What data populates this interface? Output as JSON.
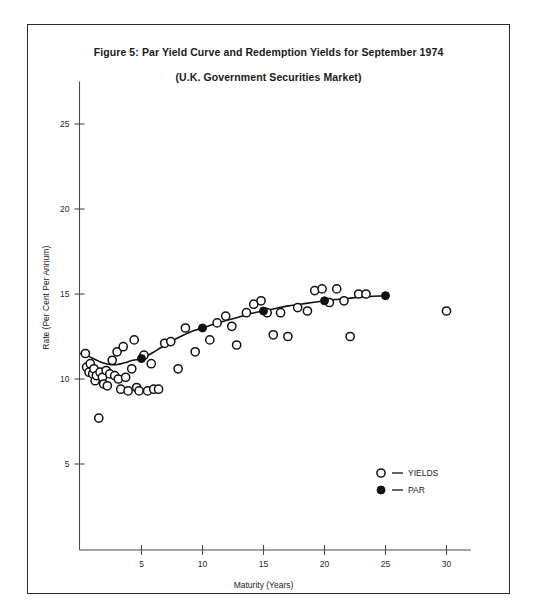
{
  "figure": {
    "title_line_1": "Figure 5:  Par Yield Curve and Redemption Yields for September 1974",
    "title_line_2": "(U.K. Government Securities Market)"
  },
  "chart_data": {
    "type": "scatter",
    "title": "Figure 5:  Par Yield Curve and Redemption Yields for September 1974",
    "subtitle": "(U.K. Government Securities Market)",
    "xlabel": "Maturity (Years)",
    "ylabel": "Rate (Per Cent Per Annum)",
    "xlim": [
      0,
      32
    ],
    "ylim": [
      0,
      27.5
    ],
    "xticks": [
      5,
      10,
      15,
      20,
      25,
      30
    ],
    "yticks": [
      5,
      10,
      15,
      20,
      25
    ],
    "xtick_labels": [
      "5",
      "10",
      "15",
      "20",
      "25",
      "30"
    ],
    "ytick_labels": [
      "5",
      "10",
      "15",
      "20",
      "25"
    ],
    "grid": false,
    "legend_position": "lower-right",
    "series": [
      {
        "name": "YIELDS",
        "marker": "open-circle",
        "points": [
          [
            0.4,
            11.5
          ],
          [
            0.5,
            10.7
          ],
          [
            0.7,
            10.4
          ],
          [
            0.8,
            10.9
          ],
          [
            1.0,
            10.3
          ],
          [
            1.1,
            10.6
          ],
          [
            1.2,
            9.9
          ],
          [
            1.3,
            10.2
          ],
          [
            1.5,
            7.7
          ],
          [
            1.6,
            10.4
          ],
          [
            1.8,
            10.1
          ],
          [
            1.9,
            9.7
          ],
          [
            2.1,
            10.5
          ],
          [
            2.2,
            9.6
          ],
          [
            2.4,
            10.3
          ],
          [
            2.6,
            11.1
          ],
          [
            2.8,
            10.2
          ],
          [
            3.0,
            11.6
          ],
          [
            3.1,
            10.0
          ],
          [
            3.3,
            9.4
          ],
          [
            3.5,
            11.9
          ],
          [
            3.7,
            10.1
          ],
          [
            3.9,
            9.3
          ],
          [
            4.2,
            10.6
          ],
          [
            4.4,
            12.3
          ],
          [
            4.6,
            9.5
          ],
          [
            4.8,
            9.3
          ],
          [
            5.2,
            11.4
          ],
          [
            5.5,
            9.3
          ],
          [
            5.8,
            10.9
          ],
          [
            6.0,
            9.4
          ],
          [
            6.4,
            9.4
          ],
          [
            6.9,
            12.1
          ],
          [
            7.4,
            12.2
          ],
          [
            8.0,
            10.6
          ],
          [
            8.6,
            13.0
          ],
          [
            9.4,
            11.6
          ],
          [
            10.6,
            12.3
          ],
          [
            11.2,
            13.3
          ],
          [
            11.9,
            13.7
          ],
          [
            12.4,
            13.1
          ],
          [
            12.8,
            12.0
          ],
          [
            13.6,
            13.9
          ],
          [
            14.2,
            14.4
          ],
          [
            14.8,
            14.6
          ],
          [
            15.3,
            13.9
          ],
          [
            15.8,
            12.6
          ],
          [
            16.4,
            13.9
          ],
          [
            17.0,
            12.5
          ],
          [
            17.8,
            14.2
          ],
          [
            18.6,
            14.0
          ],
          [
            19.2,
            15.2
          ],
          [
            19.8,
            15.3
          ],
          [
            20.4,
            14.5
          ],
          [
            21.0,
            15.3
          ],
          [
            21.6,
            14.6
          ],
          [
            22.1,
            12.5
          ],
          [
            22.8,
            15.0
          ],
          [
            23.4,
            15.0
          ],
          [
            30.0,
            14.0
          ]
        ]
      },
      {
        "name": "PAR",
        "marker": "filled-circle",
        "points": [
          [
            5.0,
            11.2
          ],
          [
            10.0,
            13.0
          ],
          [
            15.0,
            14.0
          ],
          [
            20.0,
            14.6
          ],
          [
            25.0,
            14.9
          ]
        ],
        "curve": [
          [
            0.0,
            11.5
          ],
          [
            0.6,
            11.35
          ],
          [
            1.2,
            11.15
          ],
          [
            1.8,
            10.95
          ],
          [
            2.4,
            10.85
          ],
          [
            3.0,
            10.85
          ],
          [
            3.6,
            10.95
          ],
          [
            4.3,
            11.1
          ],
          [
            5.0,
            11.2
          ],
          [
            5.8,
            11.5
          ],
          [
            6.6,
            11.85
          ],
          [
            7.4,
            12.2
          ],
          [
            8.2,
            12.5
          ],
          [
            9.1,
            12.8
          ],
          [
            10.0,
            13.0
          ],
          [
            11.0,
            13.25
          ],
          [
            12.0,
            13.45
          ],
          [
            13.0,
            13.65
          ],
          [
            14.0,
            13.85
          ],
          [
            15.0,
            14.0
          ],
          [
            16.0,
            14.15
          ],
          [
            17.0,
            14.3
          ],
          [
            18.0,
            14.4
          ],
          [
            19.0,
            14.5
          ],
          [
            20.0,
            14.6
          ],
          [
            21.0,
            14.68
          ],
          [
            22.0,
            14.75
          ],
          [
            23.0,
            14.82
          ],
          [
            24.0,
            14.87
          ],
          [
            25.0,
            14.9
          ]
        ]
      }
    ]
  },
  "legend": {
    "entries": [
      {
        "symbol": "open-circle",
        "dash": "—",
        "label": "YIELDS"
      },
      {
        "symbol": "filled-circle",
        "dash": "—",
        "label": "PAR"
      }
    ]
  },
  "axis": {
    "x_title": "Maturity (Years)",
    "y_title": "Rate (Per Cent Per Annum)"
  }
}
